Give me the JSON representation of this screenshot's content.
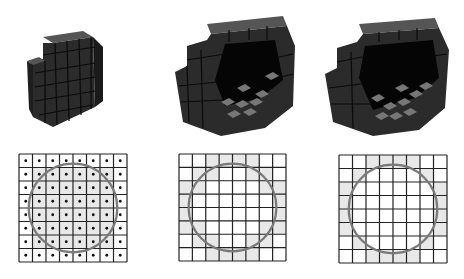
{
  "figure": {
    "colors": {
      "background": "#ffffff",
      "voxel_top": "#4a4a4a",
      "voxel_front": "#2e2e2e",
      "voxel_side": "#1c1c1c",
      "voxel_edge": "#0a0a0a",
      "voxel_inner_lit": "#7a7a7a",
      "cavity": "#050505",
      "grid_line": "#222222",
      "circle": "#7a7a7a",
      "shaded_cell": "#e8e8e8",
      "dot": "#111111"
    },
    "grid_size": 8,
    "panels": [
      {
        "id": "solid",
        "render": "solid-voxel-sphere",
        "grid": {
          "x": 18,
          "y": 153,
          "size": 108,
          "show_dots": true,
          "circle": {
            "cx": 0.5,
            "cy": 0.5,
            "r": 0.41
          },
          "shaded": [
            [
              0,
              0,
              0,
              0,
              0,
              0,
              0,
              0
            ],
            [
              0,
              1,
              1,
              1,
              1,
              1,
              1,
              0
            ],
            [
              0,
              1,
              1,
              1,
              1,
              1,
              1,
              0
            ],
            [
              0,
              1,
              1,
              1,
              1,
              1,
              1,
              0
            ],
            [
              0,
              1,
              1,
              1,
              1,
              1,
              1,
              0
            ],
            [
              0,
              1,
              1,
              1,
              1,
              1,
              1,
              0
            ],
            [
              0,
              1,
              1,
              1,
              1,
              1,
              1,
              0
            ],
            [
              0,
              0,
              0,
              0,
              0,
              0,
              0,
              0
            ]
          ]
        }
      },
      {
        "id": "shell-conservative",
        "render": "hollow-voxel-shell-thick",
        "grid": {
          "x": 178,
          "y": 153,
          "size": 107,
          "show_dots": false,
          "circle": {
            "cx": 0.5,
            "cy": 0.5,
            "r": 0.41
          },
          "shaded": [
            [
              0,
              0,
              1,
              1,
              1,
              1,
              0,
              0
            ],
            [
              0,
              1,
              1,
              0,
              0,
              1,
              1,
              0
            ],
            [
              1,
              1,
              0,
              0,
              0,
              0,
              1,
              1
            ],
            [
              1,
              0,
              0,
              0,
              0,
              0,
              0,
              1
            ],
            [
              1,
              0,
              0,
              0,
              0,
              0,
              0,
              1
            ],
            [
              1,
              1,
              0,
              0,
              0,
              0,
              1,
              1
            ],
            [
              0,
              1,
              1,
              0,
              0,
              1,
              1,
              0
            ],
            [
              0,
              0,
              1,
              1,
              1,
              1,
              0,
              0
            ]
          ]
        }
      },
      {
        "id": "shell-thin",
        "render": "hollow-voxel-shell-thin",
        "grid": {
          "x": 338,
          "y": 154,
          "size": 108,
          "show_dots": false,
          "circle": {
            "cx": 0.5,
            "cy": 0.5,
            "r": 0.41
          },
          "shaded": [
            [
              0,
              0,
              1,
              1,
              1,
              1,
              0,
              0
            ],
            [
              0,
              1,
              0,
              0,
              0,
              0,
              1,
              0
            ],
            [
              1,
              0,
              0,
              0,
              0,
              0,
              0,
              1
            ],
            [
              1,
              0,
              0,
              0,
              0,
              0,
              0,
              1
            ],
            [
              1,
              0,
              0,
              0,
              0,
              0,
              0,
              1
            ],
            [
              1,
              0,
              0,
              0,
              0,
              0,
              0,
              1
            ],
            [
              0,
              1,
              0,
              0,
              0,
              0,
              1,
              0
            ],
            [
              0,
              0,
              1,
              1,
              1,
              1,
              0,
              0
            ]
          ]
        }
      }
    ]
  }
}
